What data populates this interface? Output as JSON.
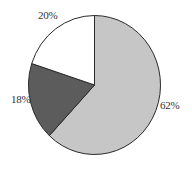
{
  "chart_data": {
    "type": "pie",
    "title": "",
    "start_angle_deg": 0,
    "direction": "clockwise",
    "slices": [
      {
        "label": "62%",
        "value": 62,
        "color": "#c6c6c6"
      },
      {
        "label": "18%",
        "value": 18,
        "color": "#5c5c5c"
      },
      {
        "label": "20%",
        "value": 20,
        "color": "#ffffff"
      }
    ],
    "legend": null,
    "outline_color": "#2a2a2a"
  },
  "labels": {
    "slice_0": "62%",
    "slice_1": "18%",
    "slice_2": "20%"
  }
}
